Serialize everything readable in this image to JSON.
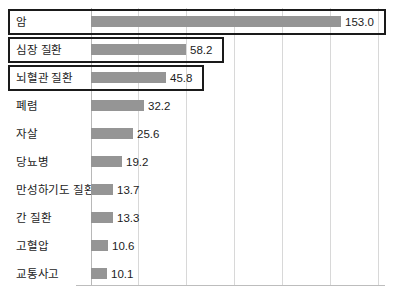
{
  "chart_data": {
    "type": "bar",
    "orientation": "horizontal",
    "title": "",
    "subtitle": "",
    "xlabel": "",
    "ylabel": "",
    "categories": [
      "암",
      "심장 질환",
      "뇌혈관 질환",
      "폐렴",
      "자살",
      "당뇨병",
      "만성하기도 질환",
      "간 질환",
      "고혈압",
      "교통사고"
    ],
    "values": [
      153.0,
      58.2,
      45.8,
      32.2,
      25.6,
      19.2,
      13.7,
      13.3,
      10.6,
      10.1
    ],
    "value_labels": [
      "153.0",
      "58.2",
      "45.8",
      "32.2",
      "25.6",
      "19.2",
      "13.7",
      "13.3",
      "10.6",
      "10.1"
    ],
    "highlighted": [
      true,
      true,
      true,
      false,
      false,
      false,
      false,
      false,
      false,
      false
    ],
    "xlim": [
      0,
      180
    ],
    "gridlines": [
      0,
      30,
      60,
      90,
      120,
      150,
      180
    ],
    "grid": true,
    "legend": "none",
    "bar_color": "#959595",
    "highlight_border_color": "#1a1a1a",
    "gridline_color": "#d8d8d8",
    "axis_color": "#bdbdbd",
    "text_color": "#1c1c1c"
  }
}
